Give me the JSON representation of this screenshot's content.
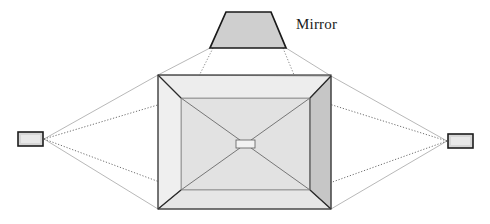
{
  "figure": {
    "background_color": "#ffffff",
    "width": 490,
    "height": 224
  },
  "labels": [
    {
      "id": "mirror",
      "text": "Mirror",
      "x": 296,
      "y": 16
    }
  ],
  "colors": {
    "outline_dark": "#1a1a1a",
    "outline_mid": "#555555",
    "outline_light": "#9a9a9a",
    "ray_solid": "#a8a8a8",
    "ray_dotted": "#4a4a4a",
    "fill_mirror": "#cfcfcf",
    "fill_box_face": "#e3e3e3",
    "fill_box_side_dark": "#c4c4c4",
    "fill_box_side_light": "#ebebeb",
    "fill_inner": "#e0e0e0",
    "fill_sensor": "#d4d4d4",
    "sensor_border": "#202020"
  },
  "elements": {
    "mirror": {
      "name": "Mirror",
      "shape": "trapezoid",
      "points": "226,12 271,12 286,48 210,48",
      "fill": "#cfcfcf",
      "stroke": "#1a1a1a",
      "stroke_width": 1.6
    },
    "outer_box": {
      "name": "Box outer rim",
      "top_left": "158,75",
      "top_right": "331,76",
      "bottom_right": "331,209",
      "bottom_left": "158,209"
    },
    "inner_box": {
      "name": "Box inner opening",
      "top_left": "181,98",
      "top_right": "310,98",
      "bottom_right": "310,190",
      "bottom_left": "181,190"
    },
    "center_target": {
      "name": "Center target rectangle",
      "x": 236,
      "y": 140,
      "width": 18,
      "height": 8,
      "fill": "#f0f0f0",
      "stroke": "#6a6a6a"
    },
    "sensor_left": {
      "name": "Left sensor",
      "x": 18,
      "y": 132,
      "width": 24,
      "height": 13,
      "anchor_x": 44,
      "anchor_y": 139
    },
    "sensor_right": {
      "name": "Right sensor",
      "x": 448,
      "y": 135,
      "width": 24,
      "height": 13,
      "anchor_x": 447,
      "anchor_y": 141
    }
  },
  "ray_lines": {
    "left_solid": [
      "44,139 158,75",
      "44,139 158,209"
    ],
    "left_dotted": [
      "44,139 181,98",
      "44,139 181,190"
    ],
    "right_solid": [
      "447,141 331,76",
      "447,141 331,209"
    ],
    "right_dotted": [
      "447,141 310,98",
      "447,141 310,190"
    ],
    "mirror_solid": [
      "210,48 158,75",
      "286,48 331,76"
    ],
    "mirror_dotted": [
      "212,48 192,90",
      "284,48 300,90"
    ]
  },
  "diagonals": [
    "181,98 310,190",
    "310,98 181,190"
  ]
}
